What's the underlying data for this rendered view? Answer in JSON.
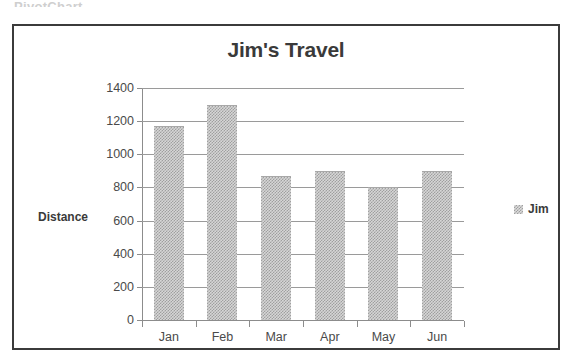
{
  "page": {
    "clipped_top_text": "PivotChart"
  },
  "legend": {
    "entries": [
      {
        "label": "Jim",
        "swatch": "pattern-checker-gray-swatch"
      }
    ]
  },
  "chart_data": {
    "type": "bar",
    "title": "Jim's Travel",
    "xlabel": "",
    "ylabel": "Distance",
    "categories": [
      "Jan",
      "Feb",
      "Mar",
      "Apr",
      "May",
      "Jun"
    ],
    "series": [
      {
        "name": "Jim",
        "values": [
          1170,
          1300,
          870,
          900,
          800,
          900
        ]
      }
    ],
    "ylim": [
      0,
      1400
    ],
    "ytick_step": 200,
    "yticks": [
      1400,
      1200,
      1000,
      800,
      600,
      400,
      200,
      0
    ],
    "ytick_labels": [
      "1400",
      "1200",
      "1000",
      "800",
      "600",
      "400",
      "200",
      "0"
    ],
    "grid": true,
    "grid_axis": "y",
    "legend_position": "right",
    "bar_fill": "#d6d6d6",
    "bar_pattern": "checker",
    "frame_color": "#3b3b3b",
    "axis_color": "#8c8c8c"
  }
}
